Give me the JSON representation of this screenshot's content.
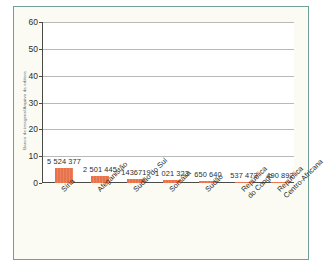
{
  "credit": {
    "text": "Banco de imagens/Arquivo da editora"
  },
  "chart_data": {
    "type": "bar",
    "title": "",
    "unit_label": "Milhões",
    "xlabel": "",
    "ylabel": "Milhões",
    "ylim": [
      0,
      60
    ],
    "yticks": [
      0,
      10,
      20,
      30,
      40,
      50,
      60
    ],
    "ytick_labels": [
      "0",
      "10",
      "20",
      "30",
      "40",
      "50",
      "60"
    ],
    "grid": true,
    "legend": "none",
    "bar_color": "#e8734a",
    "categories": [
      "Síria",
      "Afeganistão",
      "Sudão do Sul",
      "Somália",
      "Sudão",
      "República do Congo",
      "República Centro-Africana"
    ],
    "category_lines": [
      [
        "Síria"
      ],
      [
        "Afeganistão"
      ],
      [
        "Sudão do Sul"
      ],
      [
        "Somália"
      ],
      [
        "Sudão"
      ],
      [
        "República",
        "do Congo"
      ],
      [
        "República",
        "Centro-Africana"
      ]
    ],
    "values": [
      5524377,
      2501445,
      1436719,
      1021323,
      650640,
      537473,
      490892
    ],
    "values_millions": [
      5.524377,
      2.501445,
      1.436719,
      1.021323,
      0.65064,
      0.537473,
      0.490892
    ],
    "value_labels": [
      "5 524 377",
      "2 501 445",
      "1436719",
      "1 021 323",
      "650 640",
      "537 473",
      "490 892"
    ]
  }
}
